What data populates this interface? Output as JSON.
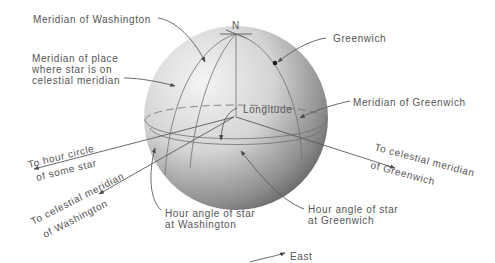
{
  "diagram": {
    "globe": {
      "north_label": "N",
      "fill_light": "#efefef",
      "fill_dark": "#5c5c5c"
    },
    "labels": {
      "meridian_washington": "Meridian of Washington",
      "meridian_place_line1": "Meridian of place",
      "meridian_place_line2": "where star is on",
      "meridian_place_line3": "celestial meridian",
      "greenwich": "Greenwich",
      "longitude": "Longitude",
      "meridian_greenwich": "Meridian of Greenwich",
      "hour_circle_line1": "To hour circle",
      "hour_circle_line2": "of some star",
      "cel_mer_wash_line1": "To celestial meridian",
      "cel_mer_wash_line2": "of Washington",
      "cel_mer_green_line1": "To celestial meridian",
      "cel_mer_green_line2": "of Greenwich",
      "ha_wash_line1": "Hour angle of star",
      "ha_wash_line2": "at Washington",
      "ha_green_line1": "Hour angle of star",
      "ha_green_line2": "at Greenwich",
      "east": "East"
    },
    "colors": {
      "text": "#555555",
      "line": "#5a5a5a"
    }
  }
}
